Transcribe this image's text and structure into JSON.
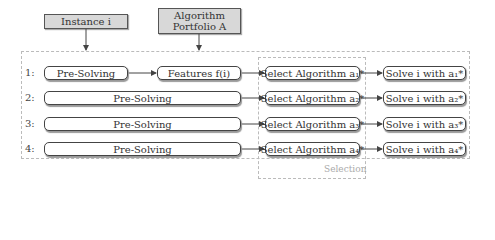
{
  "inputs": {
    "instance": "Instance i",
    "portfolio_line1": "Algorithm",
    "portfolio_line2": "Portfolio A"
  },
  "rows": [
    {
      "label": "1:",
      "presolve": "Pre-Solving",
      "features": "Features f(i)",
      "select": "Select Algorithm a₁*",
      "solve": "Solve i with a₁*"
    },
    {
      "label": "2:",
      "presolve": "Pre-Solving",
      "select": "Select Algorithm a₂*",
      "solve": "Solve i with a₂*"
    },
    {
      "label": "3:",
      "presolve": "Pre-Solving",
      "select": "Select Algorithm a₃*",
      "solve": "Solve i with a₃*"
    },
    {
      "label": "4:",
      "presolve": "Pre-Solving",
      "select": "Select Algorithm a₄*",
      "solve": "Solve i with a₄*"
    }
  ],
  "selection_group_label": "Selection",
  "colors": {
    "input_fill": "#d8d8d8",
    "border": "#444444",
    "dashed": "#bbbbbb"
  }
}
